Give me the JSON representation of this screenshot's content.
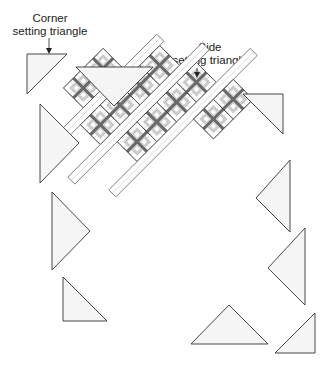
{
  "labels": {
    "corner": {
      "line1": "Corner",
      "line2": "setting triangle"
    },
    "side": {
      "line1": "Side",
      "line2": "setting triangle"
    }
  },
  "colors": {
    "background": "#ffffff",
    "outline": "#333333",
    "triangle_fill": "#f4f4f4",
    "sashing_fill": "#ffffff",
    "block_light": "#ffffff",
    "block_medium": "#c8c8c8",
    "block_dark": "#6a6a6a",
    "block_stripe": "#dddddd"
  },
  "diagram": {
    "rows": 4,
    "blocks_per_row": [
      2,
      3,
      3,
      2
    ],
    "layout": "diagonal rows with sashing strips and setting triangles"
  }
}
